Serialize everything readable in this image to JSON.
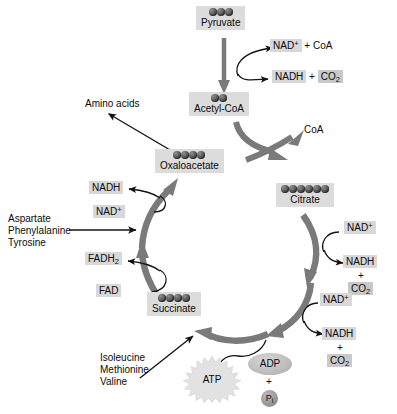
{
  "diagram": {
    "colors": {
      "highlight_box": "#dcdcdc",
      "label_highlight": "#d8d8d8",
      "cycle_arrow": "#7a7a7a",
      "thin_arrow": "#1a1a1a",
      "sphere_dark": "#343434",
      "background": "#ffffff"
    },
    "metabolites": [
      {
        "name": "Pyruvate",
        "carbons": 3
      },
      {
        "name": "Acetyl-CoA",
        "carbons": 2
      },
      {
        "name": "Oxaloacetate",
        "carbons": 4
      },
      {
        "name": "Citrate",
        "carbons": 6
      },
      {
        "name": "Succinate",
        "carbons": 4
      }
    ],
    "cofactors": {
      "nad_plus": "NAD",
      "nad_plus_charge": "+",
      "nadh": "NADH",
      "co2": "CO",
      "co2_sub": "2",
      "coa": "CoA",
      "fad": "FAD",
      "fadh2": "FADH",
      "fadh2_sub": "2",
      "atp": "ATP",
      "adp": "ADP",
      "pi": "P",
      "pi_sub": "i",
      "plus": "+"
    },
    "reactions": {
      "pyruvate_to_acetylcoa": {
        "inputs_label": "NAD",
        "inputs_suffix": " + CoA",
        "outputs_label": "NADH",
        "outputs_suffix": " + ",
        "outputs_co2": "CO"
      },
      "citrate_formation_release": "CoA",
      "isocitrate_step": {
        "in": "NAD",
        "out": "NADH",
        "co2": "CO"
      },
      "ketoglutarate_step": {
        "in": "NAD",
        "out": "NADH",
        "co2": "CO"
      },
      "succinate_to_oxaloacetate_fad": {
        "in": "FAD",
        "out": "FADH"
      },
      "malate_to_oxaloacetate_nad": {
        "in": "NAD",
        "out": "NADH"
      },
      "substrate_phosphorylation": {
        "in": "ADP",
        "plus": "+",
        "pi": "P",
        "out": "ATP"
      }
    },
    "amino_acid_inputs": {
      "oxaloacetate_exchange": "Amino acids",
      "into_cycle_left": [
        "Aspartate",
        "Phenylalanine",
        "Tyrosine"
      ],
      "into_succinate": [
        "Isoleucine",
        "Methionine",
        "Valine"
      ]
    }
  }
}
